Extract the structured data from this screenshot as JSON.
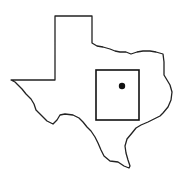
{
  "map": {
    "region": "Texas",
    "outline_color": "#222222",
    "background": "#ffffff",
    "locator_box": {
      "x": 96,
      "y": 70,
      "width": 43,
      "height": 50
    },
    "marker": {
      "cx": 122,
      "cy": 86,
      "r": 3.2,
      "color": "#111111"
    }
  }
}
